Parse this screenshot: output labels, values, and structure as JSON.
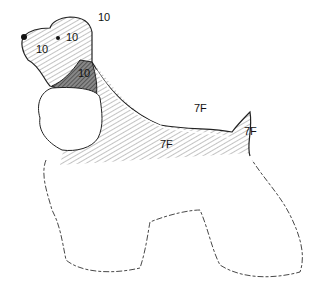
{
  "diagram": {
    "labels": [
      {
        "id": "skull",
        "text": "10"
      },
      {
        "id": "head-top",
        "text": "10"
      },
      {
        "id": "muzzle",
        "text": "10"
      },
      {
        "id": "throat",
        "text": "10"
      },
      {
        "id": "back-top",
        "text": "7F"
      },
      {
        "id": "tail",
        "text": "7F"
      },
      {
        "id": "body-side",
        "text": "7F"
      }
    ],
    "colors": {
      "ink": "#222222",
      "hatch": "#9a9a9a",
      "dense": "#555555"
    }
  }
}
